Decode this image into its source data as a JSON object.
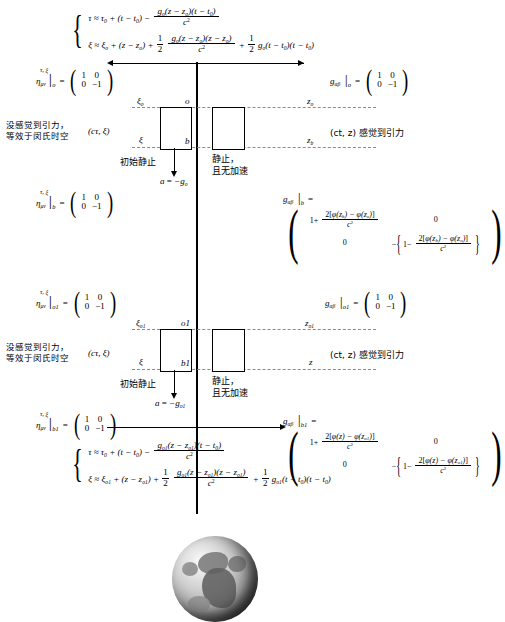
{
  "figure": {
    "type": "physics-diagram"
  },
  "top_system": {
    "brace": "{",
    "eq1": {
      "lhs": "τ ≈ τ₀ + (t − t₀) −",
      "frac_num": "gₒ(z − zₒ)(t − t₀)",
      "frac_den": "c²"
    },
    "eq2": {
      "lhs": "ξ ≈ ξₒ + (z − zₒ) +",
      "half": "1/2",
      "frac_num": "gₒ(z − zₒ)(z − zₒ)",
      "frac_den": "c²",
      "tail": "+ 1/2 gₒ(t − t₀)(t − t₀)"
    }
  },
  "bottom_system": {
    "brace": "{",
    "eq1": {
      "lhs": "τ ≈ τ₀ + (t − t₀) −",
      "frac_num": "gₒ₁(z − zₒ₁)(t − t₀)",
      "frac_den": "c²"
    },
    "eq2": {
      "lhs": "ξ ≈ ξₒ₁ + (z − zₒ₁) +",
      "half": "1/2",
      "frac_num": "gₒ₁(z − zₒ₁)(z − zₒ₁)",
      "frac_den": "c²",
      "tail": "+ 1/2 gₒ₁(t − t₀)(t − t₀)"
    }
  },
  "matrices": {
    "eta_symbol": "η",
    "eta_indices": "μν",
    "eta_super": "τ, ξ",
    "g_symbol": "g",
    "g_indices": "αβ",
    "minkowski": {
      "r0c0": "1",
      "r0c1": "0",
      "r1c0": "0",
      "r1c1": "−1"
    },
    "eta_o_sub": "o",
    "eta_b_sub": "b",
    "eta_o1_sub": "o1",
    "eta_b1_sub": "b1",
    "g_o_sub": "o",
    "g_b_sub": "b",
    "g_o1_sub": "o1",
    "g_b1_sub": "b1",
    "g_b_matrix": {
      "r0c0_prefix": "1+",
      "r0c0_num": "2[φ(z_b) − φ(z_o)]",
      "r0c0_den": "c²",
      "r0c1": "0",
      "r1c0": "0",
      "r1c1_prefix": "−",
      "r1c1_inner_prefix": "1−",
      "r1c1_num": "2[φ(z_b) − φ(z_o)]",
      "r1c1_den": "c²"
    },
    "g_b1_matrix": {
      "r0c0_prefix": "1+",
      "r0c0_num": "2[φ(z) − φ(z_o1)]",
      "r0c0_den": "c²",
      "r0c1": "0",
      "r1c0": "0",
      "r1c1_prefix": "−",
      "r1c1_inner_prefix": "1−",
      "r1c1_num": "2[φ(z) − φ(z_o1)]",
      "r1c1_den": "c²"
    }
  },
  "annotations": {
    "left_note_line1": "没感觉到引力，",
    "left_note_line2": "等效于闵氏时空",
    "left_coords": "(cτ, ξ)",
    "right_coords_note": "(ct, z) 感觉到引力",
    "falling_box_note": "初始静止",
    "static_box_note_line1": "静止，",
    "static_box_note_line2": "且无加速",
    "accel_top": "a = −gₒ",
    "accel_bottom": "a = −gₒ₁"
  },
  "diagram_labels": {
    "top_panel": {
      "xi_top": "ξₒ",
      "origin": "o",
      "z_top": "zₒ",
      "xi_bottom": "ξ",
      "point_b": "b",
      "z_bottom": "z_b"
    },
    "bottom_panel": {
      "xi_top": "ξₒ₁",
      "origin": "o1",
      "z_top": "zₒ₁",
      "xi_bottom": "ξ",
      "point_b": "b1",
      "z_bottom": "z"
    }
  },
  "earth": {
    "alt": "Earth globe grayscale"
  },
  "colors": {
    "ink": "#000000",
    "dashed": "#8a8a8a",
    "paper": "#ffffff"
  }
}
